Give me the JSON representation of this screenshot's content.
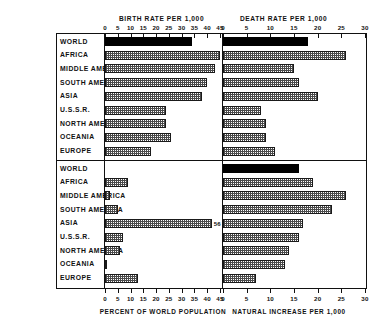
{
  "figure": {
    "background": "#ffffff",
    "ink": "#111111",
    "solid_fill": "#000000",
    "hatch_fill": "#4a4a4a"
  },
  "regions": [
    "WORLD",
    "AFRICA",
    "MIDDLE AMERICA",
    "SOUTH AMERICA",
    "ASIA",
    "U.S.S.R.",
    "NORTH AMERICA",
    "OCEANIA",
    "EUROPE"
  ],
  "panels": {
    "top_left": {
      "title": "BIRTH RATE PER 1,000"
    },
    "top_right": {
      "title": "DEATH RATE PER 1,000"
    },
    "bottom_left": {
      "caption": "PERCENT OF WORLD POPULATION"
    },
    "bottom_right": {
      "caption": "NATURAL INCREASE PER 1,000"
    }
  },
  "axis_labels": {
    "birth": [
      "0",
      "5",
      "10",
      "15",
      "20",
      "25",
      "30",
      "35",
      "40",
      "45"
    ],
    "death": [
      "0",
      "5",
      "10",
      "15",
      "20",
      "25",
      "30"
    ],
    "percent": [
      "0",
      "5",
      "10",
      "15",
      "20",
      "25",
      "30",
      "35",
      "40",
      "45"
    ],
    "increase": [
      "0",
      "5",
      "10",
      "15",
      "20",
      "25",
      "30"
    ]
  },
  "annotations": {
    "asia_percent": "56"
  },
  "chart_data": [
    {
      "type": "bar",
      "orientation": "horizontal",
      "id": "birth-rate",
      "title": "BIRTH RATE PER 1,000",
      "xlabel": "",
      "ylabel": "",
      "xlim": [
        0,
        45
      ],
      "ticks": [
        0,
        5,
        10,
        15,
        20,
        25,
        30,
        35,
        40,
        45
      ],
      "grid": false,
      "categories": [
        "WORLD",
        "AFRICA",
        "MIDDLE AMERICA",
        "SOUTH AMERICA",
        "ASIA",
        "U.S.S.R.",
        "NORTH AMERICA",
        "OCEANIA",
        "EUROPE"
      ],
      "values": [
        34,
        46,
        43,
        40,
        38,
        24,
        24,
        26,
        18
      ],
      "styles": [
        "solid",
        "hatch",
        "hatch",
        "hatch",
        "hatch",
        "hatch",
        "hatch",
        "hatch",
        "hatch"
      ]
    },
    {
      "type": "bar",
      "orientation": "horizontal",
      "id": "death-rate",
      "title": "DEATH RATE PER 1,000",
      "xlabel": "",
      "ylabel": "",
      "xlim": [
        0,
        30
      ],
      "ticks": [
        0,
        5,
        10,
        15,
        20,
        25,
        30
      ],
      "grid": false,
      "categories": [
        "WORLD",
        "AFRICA",
        "MIDDLE AMERICA",
        "SOUTH AMERICA",
        "ASIA",
        "U.S.S.R.",
        "NORTH AMERICA",
        "OCEANIA",
        "EUROPE"
      ],
      "values": [
        18,
        26,
        15,
        16,
        20,
        8,
        9,
        9,
        11
      ],
      "styles": [
        "solid",
        "hatch",
        "hatch",
        "hatch",
        "hatch",
        "hatch",
        "hatch",
        "hatch",
        "hatch"
      ]
    },
    {
      "type": "bar",
      "orientation": "horizontal",
      "id": "percent-of-world-population",
      "title": "",
      "xlabel": "PERCENT OF WORLD POPULATION",
      "ylabel": "",
      "xlim": [
        0,
        45
      ],
      "ticks": [
        0,
        5,
        10,
        15,
        20,
        25,
        30,
        35,
        40,
        45
      ],
      "grid": false,
      "categories": [
        "WORLD",
        "AFRICA",
        "MIDDLE AMERICA",
        "SOUTH AMERICA",
        "ASIA",
        "U.S.S.R.",
        "NORTH AMERICA",
        "OCEANIA",
        "EUROPE"
      ],
      "values": [
        0,
        9,
        2,
        5,
        56,
        7,
        6,
        0.5,
        13
      ],
      "styles": [
        "solid",
        "hatch",
        "hatch",
        "hatch",
        "hatch",
        "hatch",
        "hatch",
        "hatch",
        "hatch"
      ],
      "data_labels": [
        null,
        null,
        null,
        null,
        "56",
        null,
        null,
        null,
        null
      ],
      "notes": "ASIA bar exceeds axis maximum; value 56 printed at bar end. WORLD row shows no bar."
    },
    {
      "type": "bar",
      "orientation": "horizontal",
      "id": "natural-increase",
      "title": "",
      "xlabel": "NATURAL INCREASE PER 1,000",
      "ylabel": "",
      "xlim": [
        0,
        30
      ],
      "ticks": [
        0,
        5,
        10,
        15,
        20,
        25,
        30
      ],
      "grid": false,
      "categories": [
        "WORLD",
        "AFRICA",
        "MIDDLE AMERICA",
        "SOUTH AMERICA",
        "ASIA",
        "U.S.S.R.",
        "NORTH AMERICA",
        "OCEANIA",
        "EUROPE"
      ],
      "values": [
        16,
        19,
        26,
        23,
        17,
        16,
        14,
        13,
        7
      ],
      "styles": [
        "solid",
        "hatch",
        "hatch",
        "hatch",
        "hatch",
        "hatch",
        "hatch",
        "hatch",
        "hatch"
      ]
    }
  ]
}
